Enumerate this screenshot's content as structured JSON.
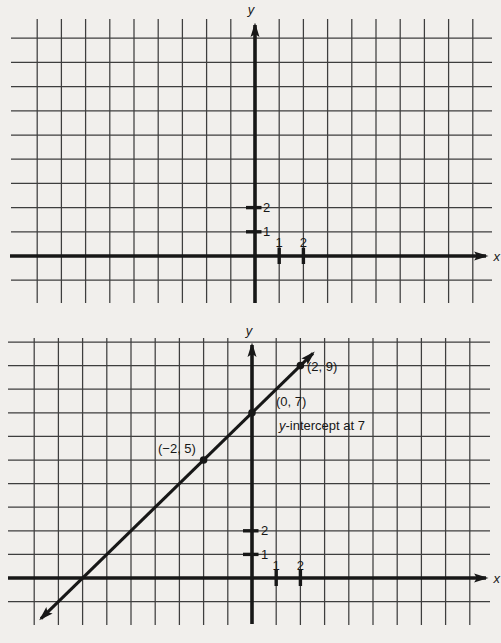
{
  "page": {
    "background": "#f1efec",
    "ink": "#171717",
    "grid_color": "#3e3e3e"
  },
  "chart_data": [
    {
      "type": "line",
      "title": "",
      "xlabel": "x",
      "ylabel": "y",
      "xlim": [
        -9,
        9
      ],
      "ylim": [
        -1,
        9
      ],
      "grid": true,
      "x_ticks": [
        {
          "value": 1,
          "label": "1"
        },
        {
          "value": 2,
          "label": "2"
        }
      ],
      "y_ticks": [
        {
          "value": 1,
          "label": "1"
        },
        {
          "value": 2,
          "label": "2"
        }
      ],
      "series": []
    },
    {
      "type": "line",
      "title": "",
      "xlabel": "x",
      "ylabel": "y",
      "xlim": [
        -9,
        9
      ],
      "ylim": [
        -2,
        10
      ],
      "grid": true,
      "x_ticks": [
        {
          "value": 1,
          "label": "1"
        },
        {
          "value": 2,
          "label": "2"
        }
      ],
      "y_ticks": [
        {
          "value": 1,
          "label": "1"
        },
        {
          "value": 2,
          "label": "2"
        }
      ],
      "series": [
        {
          "points": [
            {
              "x": -2,
              "y": 5,
              "label": "(−2, 5)"
            },
            {
              "x": 0,
              "y": 7,
              "label": "(0, 7)"
            },
            {
              "x": 2,
              "y": 9,
              "label": "(2, 9)"
            }
          ]
        }
      ],
      "annotation": {
        "italic_part": "y",
        "text_part": "-intercept at 7"
      }
    }
  ]
}
